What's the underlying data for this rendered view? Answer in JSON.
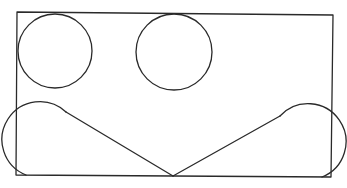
{
  "diagram": {
    "stroke_color": "#2a2a2a",
    "background": "#ffffff",
    "rectangle": {
      "tl": [
        17,
        12
      ],
      "tr": [
        333,
        15
      ],
      "br": [
        331,
        177
      ],
      "bl": [
        16,
        175
      ]
    },
    "circles": [
      {
        "name": "top-left-circle",
        "cx": 55,
        "cy": 51,
        "r": 37
      },
      {
        "name": "top-middle-circle",
        "cx": 174,
        "cy": 52,
        "r": 38
      }
    ],
    "bottom_shape": {
      "left_arc": {
        "cx": 55,
        "cy": 148,
        "r": 38
      },
      "right_arc": {
        "cx": 293,
        "cy": 151,
        "r": 38
      },
      "v_point": [
        173,
        176
      ]
    },
    "labels": []
  }
}
